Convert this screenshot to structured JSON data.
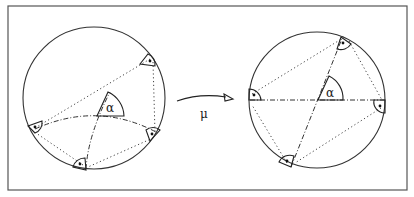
{
  "figure": {
    "type": "geometric-diagram",
    "left_panel": {
      "angle_label": "α",
      "right_angle_markers": 4
    },
    "mapping": {
      "label": "μ"
    },
    "right_panel": {
      "angle_label": "α",
      "right_angle_markers": 4
    }
  }
}
